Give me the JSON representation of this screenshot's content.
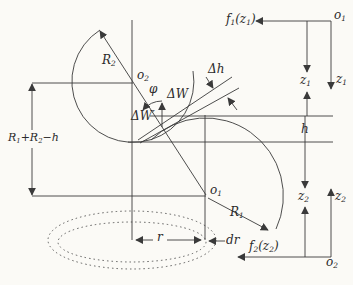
{
  "figure": {
    "colors": {
      "line": "#3a3a3a",
      "background": "#fbfaf6",
      "text": "#2b2b2b"
    },
    "labels": {
      "f1_of_z1": [
        [
          "f",
          0
        ],
        [
          "1",
          1
        ],
        [
          "(z",
          0
        ],
        [
          "1",
          1
        ],
        [
          ")",
          0
        ]
      ],
      "o1_origin": [
        [
          "o",
          0
        ],
        [
          "1",
          1
        ]
      ],
      "z1_axis": [
        [
          "z",
          0
        ],
        [
          "1",
          1
        ]
      ],
      "z1_dim": [
        [
          "z",
          0
        ],
        [
          "1",
          1
        ]
      ],
      "delta_h": [
        [
          "Δh",
          0
        ]
      ],
      "h": [
        [
          "h",
          0
        ]
      ],
      "z2_dim": [
        [
          "z",
          0
        ],
        [
          "2",
          1
        ]
      ],
      "z2_axis": [
        [
          "z",
          0
        ],
        [
          "2",
          1
        ]
      ],
      "f2_of_z2": [
        [
          "f",
          0
        ],
        [
          "2",
          1
        ],
        [
          "(z",
          0
        ],
        [
          "2",
          1
        ],
        [
          ")",
          0
        ]
      ],
      "o2_origin": [
        [
          "o",
          0
        ],
        [
          "2",
          1
        ]
      ],
      "R2": [
        [
          "R",
          0
        ],
        [
          "2",
          1
        ]
      ],
      "o2_center": [
        [
          "o",
          0
        ],
        [
          "2",
          1
        ]
      ],
      "phi": [
        [
          "φ",
          0
        ]
      ],
      "delta_W": [
        [
          "ΔW",
          0
        ]
      ],
      "delta_W_prime": [
        [
          "ΔW′",
          0
        ]
      ],
      "R1_plus_R2_minus_h": [
        [
          "R",
          0
        ],
        [
          "1",
          1
        ],
        [
          "+R",
          0
        ],
        [
          "2",
          1
        ],
        [
          "−h",
          0
        ]
      ],
      "o1_center": [
        [
          "o",
          0
        ],
        [
          "1",
          1
        ]
      ],
      "R1": [
        [
          "R",
          0
        ],
        [
          "1",
          1
        ]
      ],
      "r": [
        [
          "r",
          0
        ]
      ],
      "dr": [
        [
          "dr",
          0
        ]
      ]
    }
  }
}
